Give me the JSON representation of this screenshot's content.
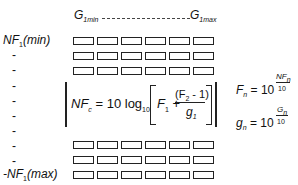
{
  "header": {
    "g_min": {
      "base": "G",
      "sub": "1min"
    },
    "g_max": {
      "base": "G",
      "sub": "1max"
    }
  },
  "row_labels": {
    "top": {
      "prefix": "NF",
      "sub": "1",
      "suffix": "(min)"
    },
    "dashes": [
      "-",
      "-",
      "-",
      "-",
      "-",
      "-",
      "-",
      "-"
    ],
    "bottom": {
      "prefix": "-NF",
      "sub": "1",
      "suffix": "(max)"
    }
  },
  "grid": {
    "columns": 6,
    "top_rows": 3,
    "bottom_rows": 3
  },
  "formulas": {
    "cascade": {
      "lhs": "NF",
      "lhs_sub": "c",
      "eq": "= 10 log",
      "log_sub": "10",
      "f1": "F",
      "f1_sub": "1",
      "plus": "+",
      "numerator": "(F",
      "num_sub": "2",
      "num_rest": " - 1)",
      "denominator": "g",
      "den_sub": "1"
    },
    "fn": {
      "lhs": "F",
      "lhs_sub": "n",
      "eq": "= 10",
      "exp_num": "NF",
      "exp_num_sub": "n",
      "exp_den": "10"
    },
    "gn": {
      "lhs": "g",
      "lhs_sub": "n",
      "eq": "= 10",
      "exp_num": "G",
      "exp_num_sub": "n",
      "exp_den": "10"
    }
  }
}
